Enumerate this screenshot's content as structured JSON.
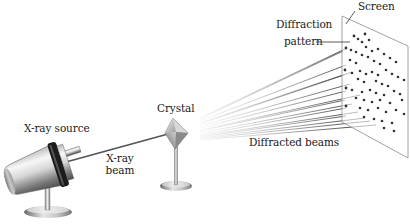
{
  "diagram": {
    "type": "X-ray diffraction apparatus",
    "labels": {
      "xray_source": "X-ray source",
      "xray_beam_line1": "X-ray",
      "xray_beam_line2": "beam",
      "crystal": "Crystal",
      "diffracted_beams": "Diffracted beams",
      "diffraction_pattern_line1": "Diffraction",
      "diffraction_pattern_line2": "pattern",
      "screen": "Screen"
    },
    "components": [
      {
        "name": "X-ray source",
        "description": "metal cylindrical tube on stand with dark collar"
      },
      {
        "name": "X-ray beam",
        "description": "line from source to crystal"
      },
      {
        "name": "Crystal",
        "description": "diamond-shaped crystal on a stand"
      },
      {
        "name": "Diffracted beams",
        "description": "fan of lines from crystal to screen"
      },
      {
        "name": "Screen",
        "description": "parallelogram screen with dot diffraction pattern"
      }
    ],
    "colors": {
      "metal_light": "#e8e8e8",
      "metal_dark": "#6e6e6e",
      "collar": "#1c1c1c",
      "beam": "#555555",
      "dot": "#333333",
      "screen_edge": "#8a8a8a"
    }
  }
}
